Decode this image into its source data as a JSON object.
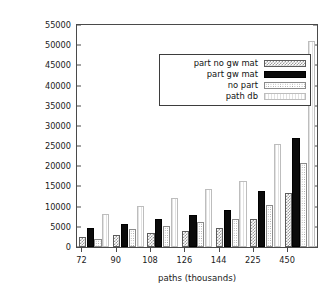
{
  "chart_data": {
    "type": "bar",
    "title": "",
    "xlabel": "paths (thousands)",
    "ylabel": "size (kbytes)",
    "categories": [
      "72",
      "90",
      "108",
      "126",
      "144",
      "225",
      "450"
    ],
    "ylim": [
      0,
      55000
    ],
    "ytick_step": 5000,
    "yticks": [
      "0",
      "5000",
      "10000",
      "15000",
      "20000",
      "25000",
      "30000",
      "35000",
      "40000",
      "45000",
      "50000",
      "55000"
    ],
    "grid": false,
    "legend_position": "upper left",
    "series": [
      {
        "name": "part no gw mat",
        "key": "s0",
        "values": [
          2500,
          2900,
          3500,
          4000,
          4600,
          6900,
          13500
        ]
      },
      {
        "name": "part gw mat",
        "key": "s1",
        "values": [
          4800,
          5700,
          6900,
          7900,
          9100,
          13900,
          27100
        ]
      },
      {
        "name": "no part",
        "key": "s2",
        "values": [
          2000,
          4500,
          5300,
          6200,
          7000,
          10500,
          20900
        ]
      },
      {
        "name": "path db",
        "key": "s3",
        "values": [
          8100,
          10200,
          12200,
          14300,
          16400,
          25600,
          51000
        ]
      }
    ]
  }
}
